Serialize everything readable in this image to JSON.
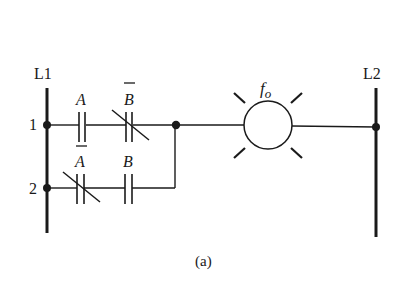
{
  "diagram": {
    "type": "ladder-logic",
    "rails": {
      "left": {
        "label": "L1"
      },
      "right": {
        "label": "L2"
      }
    },
    "rungs": [
      {
        "number": "1",
        "contacts": [
          {
            "label": "A",
            "negated": false,
            "type": "normally-open"
          },
          {
            "label": "B",
            "negated": true,
            "type": "normally-closed"
          }
        ]
      },
      {
        "number": "2",
        "contacts": [
          {
            "label": "A",
            "negated": true,
            "type": "normally-closed"
          },
          {
            "label": "B",
            "negated": false,
            "type": "normally-open"
          }
        ]
      }
    ],
    "output": {
      "label_main": "f",
      "label_sub": "o",
      "type": "lamp"
    },
    "caption": "(a)",
    "colors": {
      "ink": "#1a1a1a",
      "background": "#ffffff"
    }
  }
}
